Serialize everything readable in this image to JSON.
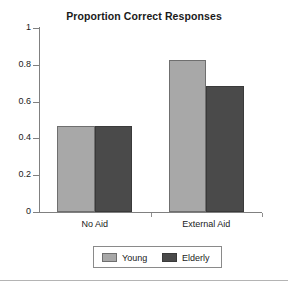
{
  "chart_data": {
    "type": "bar",
    "title": "Proportion Correct Responses",
    "xlabel": "",
    "ylabel": "",
    "categories": [
      "No Aid",
      "External Aid"
    ],
    "series": [
      {
        "name": "Young",
        "values": [
          0.465,
          0.825
        ],
        "color": "#a8a8a8"
      },
      {
        "name": "Elderly",
        "values": [
          0.465,
          0.685
        ],
        "color": "#4a4a4a"
      }
    ],
    "ylim": [
      0,
      1
    ],
    "yticks": [
      "0",
      "0.2",
      "0.4",
      "0.6",
      "0.8",
      "1"
    ],
    "ytick_values": [
      0,
      0.2,
      0.4,
      0.6,
      0.8,
      1
    ],
    "grid": false,
    "legend_position": "bottom"
  },
  "legend": {
    "entries": [
      {
        "label": "Young"
      },
      {
        "label": "Elderly"
      }
    ]
  }
}
